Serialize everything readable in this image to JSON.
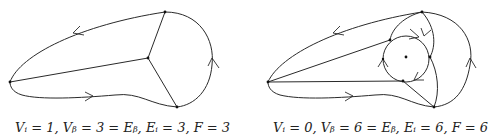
{
  "figures": [
    {
      "name": "left-graph",
      "caption": "Vᵢ = 1, Vᵦ = 3 = Eᵦ, Eᵢ = 3, F = 3",
      "counts": {
        "V_i": 1,
        "V_b": 3,
        "E_b": 3,
        "E_i": 3,
        "F": 3
      }
    },
    {
      "name": "right-graph",
      "caption": "Vᵢ = 0, Vᵦ = 6 = Eᵦ, Eᵢ = 6, F = 6",
      "counts": {
        "V_i": 0,
        "V_b": 6,
        "E_b": 6,
        "E_i": 6,
        "F": 6
      }
    }
  ],
  "colors": {
    "stroke": "#2a2a2a",
    "background": "#ffffff"
  }
}
